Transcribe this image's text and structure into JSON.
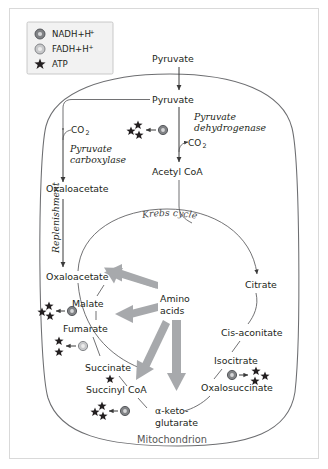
{
  "figure": {
    "compartment_label": "Mitochondrion"
  },
  "legend": {
    "items": [
      {
        "id": "nadh",
        "marker": "nadh-circle-icon",
        "label": "NADH+H",
        "superscript": "+",
        "atp_yield": 3
      },
      {
        "id": "fadh",
        "marker": "fadh-circle-icon",
        "label": "FADH+H",
        "superscript": "+",
        "atp_yield": 2
      },
      {
        "id": "atp",
        "marker": "star-icon",
        "label": "ATP",
        "superscript": "",
        "atp_yield": 1
      }
    ]
  },
  "metabolites": {
    "pyruvate_outside": "Pyruvate",
    "pyruvate_inside": "Pyruvate",
    "acetyl_coa": "Acetyl CoA",
    "oxaloacetate_upper": "Oxaloacetate",
    "oxaloacetate_cycle": "Oxaloacetate",
    "malate": "Malate",
    "fumarate": "Fumarate",
    "succinate": "Succinate",
    "succinyl_coa": "Succinyl CoA",
    "alpha_keto_line1": "α-keto-",
    "alpha_keto_line2": "glutarate",
    "oxalosuccinate": "Oxalosuccinate",
    "isocitrate": "Isocitrate",
    "cis_aconitate": "Cis-aconitate",
    "citrate": "Citrate",
    "amino_acids_line1": "Amino",
    "amino_acids_line2": "acids"
  },
  "enzymes": {
    "pyruvate_dehydrogenase_line1": "Pyruvate",
    "pyruvate_dehydrogenase_line2": "dehydrogenase",
    "pyruvate_carboxylase_line1": "Pyruvate",
    "pyruvate_carboxylase_line2": "carboxylase"
  },
  "annotations": {
    "co2_carboxylase": "CO",
    "co2_carboxylase_sub": "2",
    "co2_dehydrogenase": "CO",
    "co2_dehydrogenase_sub": "2",
    "replenishment": "Replenishment",
    "krebs_cycle": "Krebs cycle"
  },
  "cofactor_steps": [
    {
      "id": "pyruvate-to-acetyl-coa",
      "cofactor": "nadh",
      "atp_count": 3
    },
    {
      "id": "malate-to-oxaloacetate",
      "cofactor": "nadh",
      "atp_count": 3
    },
    {
      "id": "succinate-to-fumarate",
      "cofactor": "fadh",
      "atp_count": 2
    },
    {
      "id": "alpha-ketoglutarate-to-succinyl-coa",
      "cofactor": "nadh",
      "atp_count": 3
    },
    {
      "id": "isocitrate-to-oxalosuccinate",
      "cofactor": "nadh",
      "atp_count": 3
    },
    {
      "id": "succinyl-coa-to-succinate",
      "cofactor": "atp",
      "atp_count": 1
    }
  ],
  "colors": {
    "gray_arrow": "#a7a9ac",
    "line": "#58595b",
    "membrane": "#6d6e71",
    "nadh_marker": "#808285",
    "fadh_marker": "#c7c8ca",
    "text": "#231f20",
    "legend_background": "#f2f2f2",
    "frame_border": "#d9d9d9"
  }
}
